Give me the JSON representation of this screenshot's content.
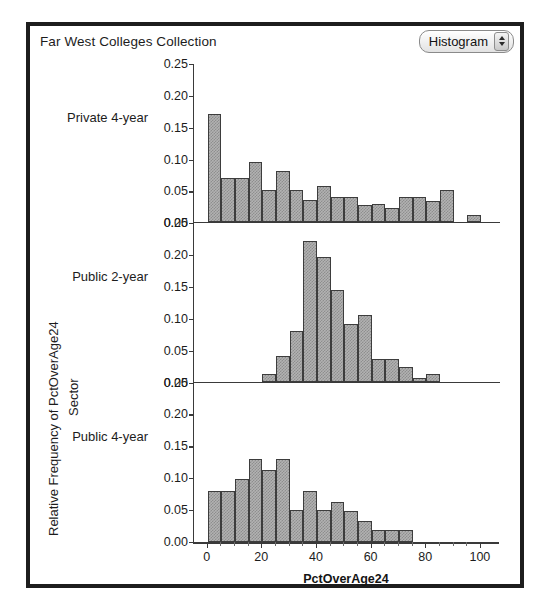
{
  "window": {
    "collection_title": "Far West Colleges Collection",
    "plot_type": {
      "label": "Histogram",
      "stepper_up_icon": "triangle-up-icon",
      "stepper_down_icon": "triangle-down-icon"
    }
  },
  "chart_data": {
    "type": "bar",
    "title": "Far West Colleges Collection",
    "subtype": "faceted-histogram",
    "xlabel": "PctOverAge24",
    "ylabel": "Relative Frequency of PctOverAge24",
    "facet_label": "Sector",
    "xlim": [
      -5,
      107
    ],
    "ylim": [
      0.0,
      0.25
    ],
    "grid": false,
    "legend": "none",
    "bin_width": 5,
    "xticks": [
      0,
      20,
      40,
      60,
      80,
      100
    ],
    "xtick_labels": [
      "0",
      "20",
      "40",
      "60",
      "80",
      "100"
    ],
    "yticks": [
      0.0,
      0.05,
      0.1,
      0.15,
      0.2,
      0.25
    ],
    "ytick_labels": [
      "0.00",
      "0.05",
      "0.10",
      "0.15",
      "0.20",
      "0.25"
    ],
    "panels": [
      {
        "name": "Private 4-year",
        "bins": [
          0,
          5,
          10,
          15,
          20,
          25,
          30,
          35,
          40,
          45,
          50,
          55,
          60,
          65,
          70,
          75,
          80,
          85,
          90,
          95,
          100
        ],
        "values": [
          0.17,
          0.07,
          0.07,
          0.095,
          0.05,
          0.08,
          0.05,
          0.035,
          0.057,
          0.04,
          0.04,
          0.027,
          0.028,
          0.022,
          0.04,
          0.04,
          0.033,
          0.05,
          0.0,
          0.012
        ]
      },
      {
        "name": "Public 2-year",
        "bins": [
          0,
          5,
          10,
          15,
          20,
          25,
          30,
          35,
          40,
          45,
          50,
          55,
          60,
          65,
          70,
          75,
          80,
          85,
          90,
          95,
          100
        ],
        "values": [
          0.0,
          0.0,
          0.0,
          0.0,
          0.012,
          0.04,
          0.08,
          0.22,
          0.195,
          0.143,
          0.09,
          0.105,
          0.035,
          0.035,
          0.023,
          0.005,
          0.012,
          0.0,
          0.0,
          0.0
        ]
      },
      {
        "name": "Public 4-year",
        "bins": [
          0,
          5,
          10,
          15,
          20,
          25,
          30,
          35,
          40,
          45,
          50,
          55,
          60,
          65,
          70,
          75,
          80,
          85,
          90,
          95,
          100
        ],
        "values": [
          0.08,
          0.08,
          0.098,
          0.13,
          0.113,
          0.13,
          0.05,
          0.08,
          0.05,
          0.062,
          0.049,
          0.033,
          0.019,
          0.019,
          0.019,
          0.0,
          0.0,
          0.0,
          0.0,
          0.0
        ]
      }
    ]
  }
}
